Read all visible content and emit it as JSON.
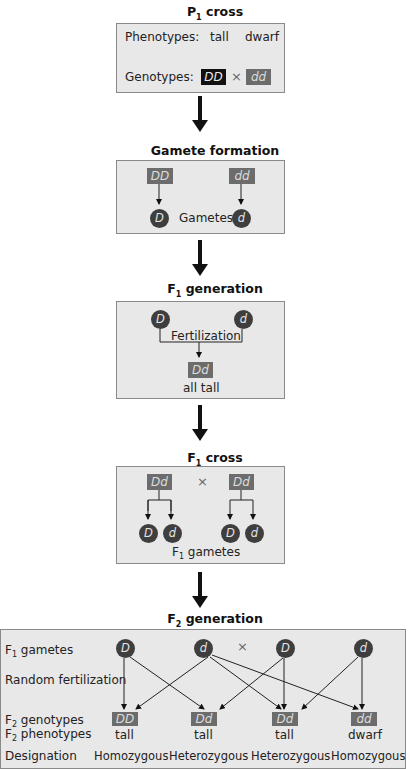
{
  "p1_cross": {
    "title_main": "P",
    "title_sub": "1",
    "title_rest": " cross",
    "phenotypes_label": "Phenotypes:",
    "phenotype_1": "tall",
    "phenotype_2": "dwarf",
    "genotypes_label": "Genotypes:",
    "genotype_1": "DD",
    "cross_symbol": "×",
    "genotype_2": "dd"
  },
  "gamete_formation": {
    "title": "Gamete formation",
    "parent_1": "DD",
    "parent_2": "dd",
    "gamete_1": "D",
    "gamete_2": "d",
    "gametes_label": "Gametes"
  },
  "f1_generation": {
    "title_main": "F",
    "title_sub": "1",
    "title_rest": " generation",
    "gamete_1": "D",
    "gamete_2": "d",
    "fertilization_label": "Fertilization",
    "offspring": "Dd",
    "phenotype": "all tall"
  },
  "f1_cross": {
    "title_main": "F",
    "title_sub": "1",
    "title_rest": " cross",
    "parent_1": "Dd",
    "cross_symbol": "×",
    "parent_2": "Dd",
    "gametes": [
      "D",
      "d",
      "D",
      "d"
    ],
    "gametes_label_main": "F",
    "gametes_label_sub": "1",
    "gametes_label_rest": " gametes"
  },
  "f2_generation": {
    "title_main": "F",
    "title_sub": "2",
    "title_rest": " generation",
    "row_labels": {
      "f1_gametes": {
        "main": "F",
        "sub": "1",
        "rest": " gametes"
      },
      "random_fertilization": "Random fertilization",
      "f2_genotypes": {
        "main": "F",
        "sub": "2",
        "rest": " genotypes"
      },
      "f2_phenotypes": {
        "main": "F",
        "sub": "2",
        "rest": " phenotypes"
      },
      "designation": "Designation"
    },
    "gametes": [
      "D",
      "d",
      "D",
      "d"
    ],
    "cross_symbol": "×",
    "genotypes": [
      "DD",
      "Dd",
      "Dd",
      "dd"
    ],
    "phenotypes": [
      "tall",
      "tall",
      "tall",
      "dwarf"
    ],
    "designations": [
      "Homozygous",
      "Heterozygous",
      "Heterozygous",
      "Homozygous"
    ]
  },
  "colors": {
    "panel_bg": "#e8e8e8",
    "panel_border": "#8a8a8a",
    "genotype_box": "#6c6c6c",
    "genotype_box_dark": "#111111",
    "gamete_circle": "#3e3e3e"
  }
}
